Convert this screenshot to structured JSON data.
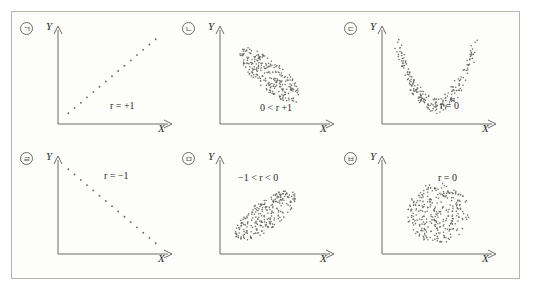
{
  "figure": {
    "border_color": "#b9b4ac",
    "background_color": "#fdfdfb",
    "axis_color": "#6f6b66",
    "dot_color": "#6b6b6b"
  },
  "chart_data": {
    "type": "scatter",
    "title": "",
    "xlabel": "X",
    "ylabel": "Y",
    "grid": false,
    "legend": "none",
    "panel_count": 6,
    "layout": {
      "rows": 2,
      "cols": 3
    },
    "panels": [
      {
        "tag": "ㄱ",
        "tag_circled": "㉠",
        "xlabel": "X",
        "ylabel": "Y",
        "annotation": "r = +1",
        "r_symbol": "r",
        "r_relation": "=",
        "r_value": "+1",
        "pattern": "perfect-positive-line",
        "description": "dots on a straight rising line",
        "points": [
          [
            0.08,
            0.1
          ],
          [
            0.14,
            0.16
          ],
          [
            0.2,
            0.22
          ],
          [
            0.26,
            0.28
          ],
          [
            0.32,
            0.34
          ],
          [
            0.38,
            0.4
          ],
          [
            0.44,
            0.46
          ],
          [
            0.5,
            0.52
          ],
          [
            0.56,
            0.58
          ],
          [
            0.62,
            0.64
          ],
          [
            0.68,
            0.7
          ],
          [
            0.74,
            0.76
          ],
          [
            0.8,
            0.82
          ],
          [
            0.86,
            0.88
          ],
          [
            0.92,
            0.94
          ]
        ]
      },
      {
        "tag": "ㄴ",
        "tag_circled": "㉡",
        "xlabel": "X",
        "ylabel": "Y",
        "annotation": "0 < r +1",
        "r_symbol": "r",
        "r_relation": "0 <",
        "r_value": "+1",
        "pattern": "positive-ellipse-cloud",
        "description": "dense ellipse tilted up to the right",
        "cloud": {
          "cx": 0.46,
          "cy": 0.53,
          "rx": 0.4,
          "ry": 0.15,
          "angle": -48,
          "n": 260
        }
      },
      {
        "tag": "ㄷ",
        "tag_circled": "㉢",
        "xlabel": "X",
        "ylabel": "Y",
        "annotation": "r = 0",
        "r_symbol": "r",
        "r_relation": "=",
        "r_value": "0",
        "pattern": "u-shape-band",
        "description": "U shaped curved band of dots",
        "cloud": {
          "n": 230,
          "shape": "parabola-band"
        }
      },
      {
        "tag": "ㄹ",
        "tag_circled": "㉣",
        "xlabel": "X",
        "ylabel": "Y",
        "annotation": "r = −1",
        "r_symbol": "r",
        "r_relation": "=",
        "r_value": "−1",
        "pattern": "perfect-negative-line",
        "description": "dots on a straight falling line",
        "points": [
          [
            0.08,
            0.94
          ],
          [
            0.14,
            0.88
          ],
          [
            0.2,
            0.82
          ],
          [
            0.26,
            0.76
          ],
          [
            0.32,
            0.7
          ],
          [
            0.38,
            0.64
          ],
          [
            0.44,
            0.58
          ],
          [
            0.5,
            0.52
          ],
          [
            0.56,
            0.46
          ],
          [
            0.62,
            0.4
          ],
          [
            0.68,
            0.34
          ],
          [
            0.74,
            0.28
          ],
          [
            0.8,
            0.22
          ],
          [
            0.86,
            0.16
          ],
          [
            0.92,
            0.1
          ]
        ]
      },
      {
        "tag": "ㅁ",
        "tag_circled": "㉤",
        "xlabel": "X",
        "ylabel": "Y",
        "annotation": "−1 < r < 0",
        "r_symbol": "r",
        "r_relation": "−1 <",
        "r_value": "< 0",
        "pattern": "negative-ellipse-cloud",
        "description": "dense ellipse tilted down to the right",
        "cloud": {
          "cx": 0.42,
          "cy": 0.42,
          "rx": 0.38,
          "ry": 0.15,
          "angle": 44,
          "n": 250
        }
      },
      {
        "tag": "ㅂ",
        "tag_circled": "㉥",
        "xlabel": "X",
        "ylabel": "Y",
        "annotation": "r = 0",
        "r_symbol": "r",
        "r_relation": "=",
        "r_value": "0",
        "pattern": "circular-cloud",
        "description": "round blob of dots, no trend",
        "cloud": {
          "cx": 0.52,
          "cy": 0.44,
          "rx": 0.3,
          "ry": 0.34,
          "angle": 0,
          "n": 300
        }
      }
    ]
  }
}
